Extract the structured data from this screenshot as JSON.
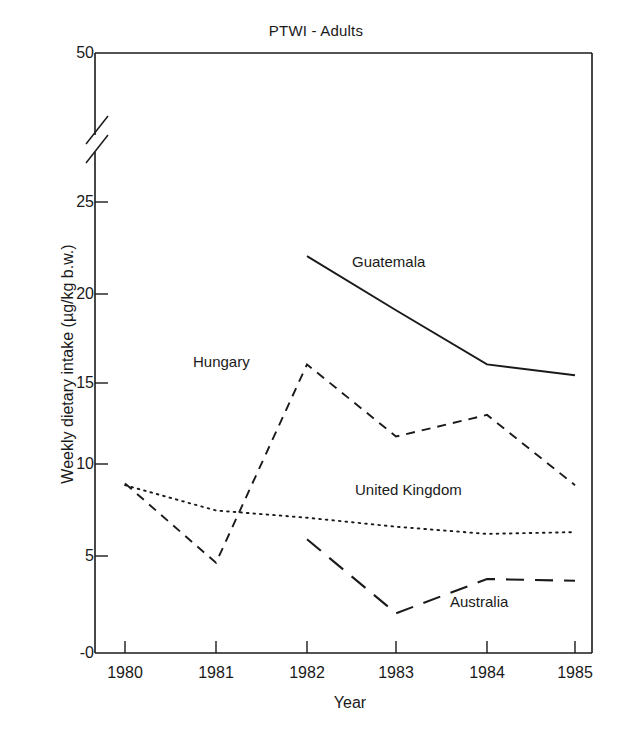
{
  "chart_data": {
    "type": "line",
    "title": "PTWI - Adults",
    "xlabel": "Year",
    "ylabel": "Weekly dietary intake (µg/kg b.w.)",
    "x": [
      1980,
      1981,
      1982,
      1983,
      1984,
      1985
    ],
    "xtick_labels": [
      "1980",
      "1981",
      "1982",
      "1983",
      "1984",
      "1985"
    ],
    "ytick_labels": [
      "-0",
      "5",
      "10",
      "15",
      "20",
      "25",
      "50"
    ],
    "ytick_values": [
      0,
      5,
      10,
      15,
      20,
      25,
      50
    ],
    "ylim": [
      0,
      50
    ],
    "axis_break": "y-axis broken between 25 and 50",
    "grid": false,
    "legend": "inline data labels",
    "series": [
      {
        "name": "Guatemala",
        "line_style": "solid",
        "x": [
          1982,
          1983,
          1984,
          1985
        ],
        "values": [
          22.0,
          19.0,
          16.0,
          15.4
        ],
        "label_x": 1982.9,
        "label_y": 20.6
      },
      {
        "name": "Hungary",
        "line_style": "dashed",
        "x": [
          1980,
          1981,
          1982,
          1983,
          1984,
          1985
        ],
        "values": [
          9.4,
          5.0,
          16.0,
          12.0,
          13.2,
          9.3
        ],
        "label_x": 1980.6,
        "label_y": 15.3
      },
      {
        "name": "United Kingdom",
        "line_style": "dotted",
        "x": [
          1980,
          1981,
          1982,
          1983,
          1984,
          1985
        ],
        "values": [
          9.3,
          7.9,
          7.5,
          7.0,
          6.6,
          6.7
        ],
        "label_x": 1982.6,
        "label_y": 9.1
      },
      {
        "name": "Australia",
        "line_style": "long-dash",
        "x": [
          1982,
          1983,
          1984,
          1985
        ],
        "values": [
          6.3,
          2.2,
          4.1,
          4.0
        ],
        "label_x": 1983.9,
        "label_y": 2.0
      }
    ]
  },
  "axis": {
    "y_ticks": [
      {
        "label": "50",
        "top": 53
      },
      {
        "label": "25",
        "top": 202
      },
      {
        "label": "20",
        "top": 294
      },
      {
        "label": "15",
        "top": 383
      },
      {
        "label": "10",
        "top": 464
      },
      {
        "label": "5",
        "top": 556
      },
      {
        "label": "-0",
        "top": 653
      }
    ],
    "x_ticks": [
      {
        "label": "1980",
        "left": 125
      },
      {
        "label": "1981",
        "left": 216
      },
      {
        "label": "1982",
        "left": 307
      },
      {
        "label": "1983",
        "left": 396
      },
      {
        "label": "1984",
        "left": 487
      },
      {
        "label": "1985",
        "left": 575
      }
    ]
  },
  "series_labels": [
    {
      "name": "Guatemala",
      "left": 352,
      "top": 262
    },
    {
      "name": "Hungary",
      "left": 193,
      "top": 361
    },
    {
      "name": "United Kingdom",
      "left": 355,
      "top": 490
    },
    {
      "name": "Australia",
      "left": 450,
      "top": 601
    }
  ],
  "colors": {
    "ink": "#1a1a1a",
    "background": "#ffffff"
  }
}
